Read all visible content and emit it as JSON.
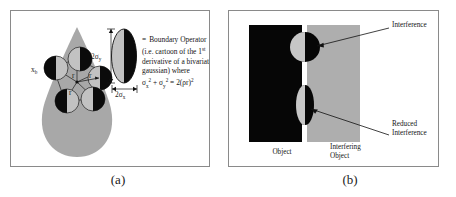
{
  "figure": {
    "panels": [
      {
        "id": "a",
        "caption": "(a)",
        "vertical_dim_label": "2σ",
        "vertical_dim_sub": "y",
        "horizontal_dim_label": "2σ",
        "horizontal_dim_sub": "x",
        "boundary_point_label": "x",
        "boundary_point_sub": "b",
        "radius_label_1": "r",
        "radius_label_2": "r",
        "radius_label_3": "r",
        "legend": {
          "line1_eq": "=",
          "line1": "Boundary Operator",
          "line2_a": "(i.e. cartoon of the 1",
          "line2_sup": "st",
          "line3": "derivative of a bivariate",
          "line4": "gaussian) where",
          "formula": {
            "sigma1": "σ",
            "sigma1_sub": "x",
            "sigma1_sup": "2",
            "plus": "+",
            "sigma2": "σ",
            "sigma2_sub": "y",
            "sigma2_sup": "2",
            "equals": "=",
            "rhs": "2(ρr)",
            "rhs_sup": "2"
          }
        }
      },
      {
        "id": "b",
        "caption": "(b)",
        "labels": {
          "interference": "Interference",
          "reduced_line1": "Reduced",
          "reduced_line2": "Interference",
          "object": "Object",
          "interfering_line1": "Interfering",
          "interfering_line2": "Object"
        }
      }
    ]
  },
  "colors": {
    "panel_border": "#8a8a8a",
    "teardrop_gray": "#a8a8a8",
    "operator_gray": "#b4b4b4",
    "black": "#0b0b0b",
    "object_black": "#060606",
    "interfering_gray": "#aeaeae",
    "paper_white": "#ffffff",
    "text": "#141414"
  }
}
